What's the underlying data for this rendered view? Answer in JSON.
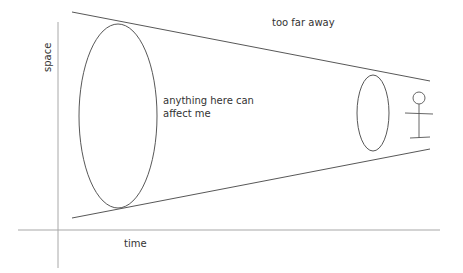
{
  "diagram": {
    "axes": {
      "x_label": "time",
      "y_label": "space",
      "color": "#a8a8a8"
    },
    "labels": {
      "far": "too far away",
      "near_line1": "anything here can",
      "near_line2": "affect me"
    },
    "colors": {
      "stroke": "#444444",
      "text": "#333333",
      "background": "#ffffff"
    },
    "elements": [
      {
        "type": "cone-boundary",
        "position": "top"
      },
      {
        "type": "cone-boundary",
        "position": "bottom"
      },
      {
        "type": "ellipse",
        "size": "large",
        "region": "near"
      },
      {
        "type": "ellipse",
        "size": "small",
        "region": "far"
      },
      {
        "type": "stick-figure",
        "represents": "me"
      }
    ]
  }
}
